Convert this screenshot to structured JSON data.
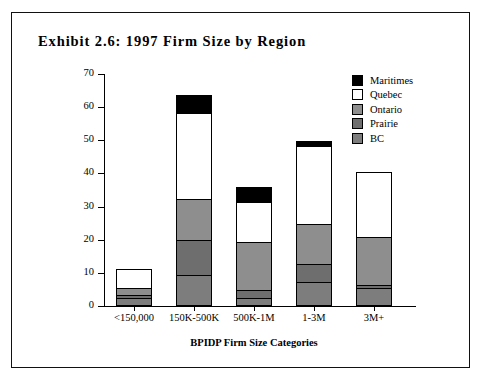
{
  "figure": {
    "title": "Exhibit 2.6:  1997  Firm  Size  by  Region"
  },
  "chart_data": {
    "type": "bar",
    "stacked": true,
    "title": "Exhibit 2.6:  1997  Firm  Size  by  Region",
    "xlabel": "BPIDP Firm Size Categories",
    "ylabel": "Number of Firms",
    "ylim": [
      0,
      70
    ],
    "yticks": [
      0,
      10,
      20,
      30,
      40,
      50,
      60,
      70
    ],
    "grid": false,
    "legend_position": "top-right",
    "categories": [
      "<150,000",
      "150K-500K",
      "500K-1M",
      "1-3M",
      "3M+"
    ],
    "series": [
      {
        "name": "BC",
        "color": "#7d7d7d",
        "values": [
          2,
          9,
          2,
          7,
          5
        ]
      },
      {
        "name": "Prairie",
        "color": "#6e6e6e",
        "values": [
          1,
          10.5,
          2.5,
          5.5,
          1
        ]
      },
      {
        "name": "Ontario",
        "color": "#8e8e8e",
        "values": [
          2,
          12.5,
          14.5,
          12,
          14.5
        ]
      },
      {
        "name": "Quebec",
        "color": "#ffffff",
        "values": [
          6,
          26,
          12,
          23.5,
          19.5
        ]
      },
      {
        "name": "Maritimes",
        "color": "#000000",
        "values": [
          0,
          5.5,
          4.5,
          1.5,
          0
        ]
      }
    ],
    "totals": [
      11,
      63.5,
      35.5,
      49.5,
      40
    ]
  },
  "legend": {
    "items": [
      {
        "label": "Maritimes",
        "color": "#000000"
      },
      {
        "label": "Quebec",
        "color": "#ffffff"
      },
      {
        "label": "Ontario",
        "color": "#8e8e8e"
      },
      {
        "label": "Prairie",
        "color": "#6e6e6e"
      },
      {
        "label": "BC",
        "color": "#7d7d7d"
      }
    ]
  }
}
